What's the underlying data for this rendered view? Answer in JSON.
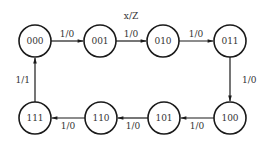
{
  "diagram": {
    "type": "state-diagram",
    "legend": "x/Z",
    "colors": {
      "stroke": "#1a1a1a",
      "text": "#333333",
      "background": "#ffffff"
    },
    "states": [
      {
        "id": "s000",
        "label": "000",
        "cx": 35,
        "cy": 41
      },
      {
        "id": "s001",
        "label": "001",
        "cx": 100,
        "cy": 41
      },
      {
        "id": "s010",
        "label": "010",
        "cx": 163,
        "cy": 41
      },
      {
        "id": "s011",
        "label": "011",
        "cx": 230,
        "cy": 41
      },
      {
        "id": "s100",
        "label": "100",
        "cx": 230,
        "cy": 118
      },
      {
        "id": "s101",
        "label": "101",
        "cx": 164,
        "cy": 118
      },
      {
        "id": "s110",
        "label": "110",
        "cx": 101,
        "cy": 118
      },
      {
        "id": "s111",
        "label": "111",
        "cx": 35,
        "cy": 118
      }
    ],
    "transitions": [
      {
        "from": "000",
        "to": "001",
        "label": "1/0"
      },
      {
        "from": "001",
        "to": "010",
        "label": "1/0"
      },
      {
        "from": "010",
        "to": "011",
        "label": "1/0"
      },
      {
        "from": "011",
        "to": "100",
        "label": "1/0"
      },
      {
        "from": "100",
        "to": "101",
        "label": "1/0"
      },
      {
        "from": "101",
        "to": "110",
        "label": "1/0"
      },
      {
        "from": "110",
        "to": "111",
        "label": "1/0"
      },
      {
        "from": "111",
        "to": "000",
        "label": "1/1"
      }
    ]
  }
}
